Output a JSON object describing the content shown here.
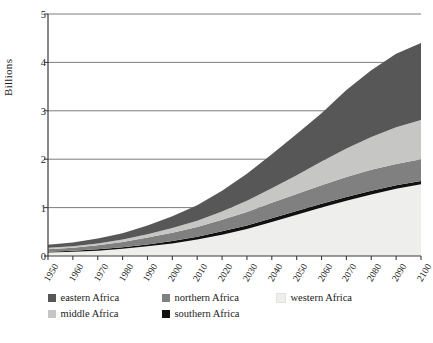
{
  "chart_data": {
    "type": "area",
    "stacked": true,
    "title": "",
    "xlabel": "",
    "ylabel": "Billions",
    "ylim": [
      0,
      5
    ],
    "yticks": [
      0,
      1,
      2,
      3,
      4,
      5
    ],
    "xlim": [
      1950,
      2100
    ],
    "grid": true,
    "legend_position": "bottom",
    "x": [
      1950,
      1960,
      1970,
      1980,
      1990,
      2000,
      2010,
      2020,
      2030,
      2040,
      2050,
      2060,
      2070,
      2080,
      2090,
      2100
    ],
    "stack_order_bottom_to_top": [
      "western Africa",
      "southern Africa",
      "northern Africa",
      "middle Africa",
      "eastern Africa"
    ],
    "series": [
      {
        "name": "western Africa",
        "color": "#eeeeec",
        "values": [
          0.07,
          0.09,
          0.11,
          0.15,
          0.2,
          0.26,
          0.34,
          0.44,
          0.56,
          0.7,
          0.85,
          1.0,
          1.14,
          1.27,
          1.39,
          1.48
        ]
      },
      {
        "name": "southern Africa",
        "color": "#111111",
        "values": [
          0.02,
          0.02,
          0.03,
          0.03,
          0.04,
          0.05,
          0.06,
          0.07,
          0.07,
          0.08,
          0.08,
          0.08,
          0.08,
          0.08,
          0.07,
          0.07
        ]
      },
      {
        "name": "northern Africa",
        "color": "#808080",
        "values": [
          0.05,
          0.06,
          0.08,
          0.11,
          0.14,
          0.17,
          0.2,
          0.24,
          0.28,
          0.32,
          0.35,
          0.38,
          0.41,
          0.43,
          0.44,
          0.45
        ]
      },
      {
        "name": "middle Africa",
        "color": "#c6c6c4",
        "values": [
          0.03,
          0.03,
          0.04,
          0.05,
          0.07,
          0.1,
          0.13,
          0.17,
          0.23,
          0.3,
          0.39,
          0.49,
          0.59,
          0.68,
          0.76,
          0.81
        ]
      },
      {
        "name": "eastern Africa",
        "color": "#575757",
        "values": [
          0.06,
          0.08,
          0.1,
          0.13,
          0.18,
          0.24,
          0.32,
          0.43,
          0.56,
          0.7,
          0.85,
          1.0,
          1.21,
          1.38,
          1.52,
          1.59
        ]
      }
    ],
    "totals": [
      0.23,
      0.28,
      0.36,
      0.47,
      0.63,
      0.82,
      1.05,
      1.35,
      1.7,
      2.1,
      2.52,
      2.95,
      3.43,
      3.84,
      4.18,
      4.4
    ]
  },
  "axis": {
    "ylabel": "Billions",
    "yticks": [
      "0",
      "1",
      "2",
      "3",
      "4",
      "5"
    ],
    "xticks": [
      "1950",
      "1960",
      "1970",
      "1980",
      "1990",
      "2000",
      "2010",
      "2020",
      "2030",
      "2040",
      "2050",
      "2060",
      "2070",
      "2080",
      "2090",
      "2100"
    ]
  },
  "legend": {
    "items": [
      {
        "label": "eastern Africa",
        "color": "#575757"
      },
      {
        "label": "northern Africa",
        "color": "#808080"
      },
      {
        "label": "western Africa",
        "color": "#eeeeec"
      },
      {
        "label": "middle Africa",
        "color": "#c6c6c4"
      },
      {
        "label": "southern Africa",
        "color": "#111111"
      }
    ]
  },
  "colors": {
    "background": "#ffffff",
    "axis": "#3a3a3a",
    "grid": "#6e6e6e",
    "text": "#1a1a1a"
  }
}
